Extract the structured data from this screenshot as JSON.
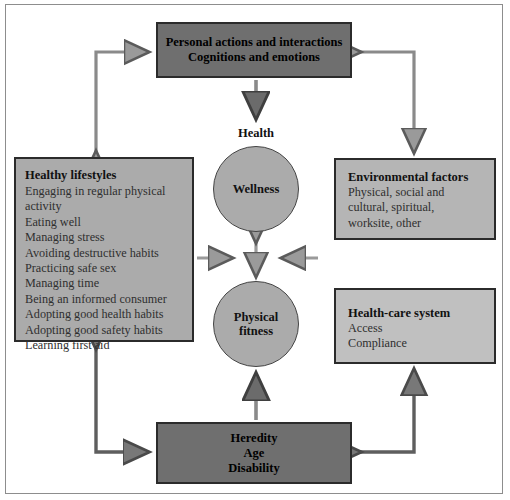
{
  "diagram": {
    "colors": {
      "dark_box": "#6f6f6f",
      "mid_box": "#ababab",
      "light_box": "#c0c0c0",
      "circle": "#ababab",
      "arrow_fill": "#9a9a9a",
      "arrow_stroke": "#5b5b5b",
      "frame": "#8d8d8d"
    },
    "top_box": {
      "line1": "Personal actions and interactions",
      "line2": "Cognitions and emotions"
    },
    "bottom_box": {
      "line1": "Heredity",
      "line2": "Age",
      "line3": "Disability"
    },
    "lifestyles": {
      "title": "Healthy lifestyles",
      "items": [
        "Engaging in regular physical\n   activity",
        "Eating well",
        "Managing stress",
        "Avoiding destructive habits",
        "Practicing safe sex",
        "Managing time",
        "Being an informed consumer",
        "Adopting good health habits",
        "Adopting good safety habits",
        "Learning first aid"
      ]
    },
    "environment": {
      "title": "Environmental factors",
      "body": "Physical, social and\n    cultural, spiritual,\n    worksite, other"
    },
    "healthcare": {
      "title": "Health-care system",
      "item1": "Access",
      "item2": "Compliance"
    },
    "center": {
      "health_label": "Health",
      "wellness": "Wellness",
      "fitness_line1": "Physical",
      "fitness_line2": "fitness"
    }
  }
}
